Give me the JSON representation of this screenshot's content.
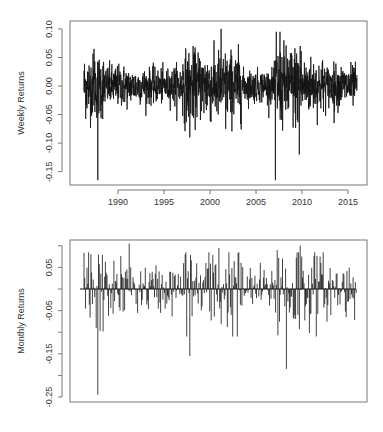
{
  "chart_data": [
    {
      "type": "line",
      "title": "",
      "xlabel": "",
      "ylabel": "Weekly Returns",
      "x_ticks": [
        1990,
        1995,
        2000,
        2005,
        2010,
        2015
      ],
      "y_ticks": [
        0.1,
        0.05,
        0.0,
        -0.05,
        -0.1,
        -0.15
      ],
      "y_tick_labels": [
        "0.10",
        "0.05",
        "0.00",
        "-0.05",
        "-0.10",
        "-0.15"
      ],
      "xlim": [
        1985.6,
        2017.4
      ],
      "ylim": [
        -0.17,
        0.105
      ],
      "x_range_data": [
        1986.3,
        2016.0
      ],
      "grid": false,
      "legend": null,
      "notable_points": [
        {
          "x": 1987.8,
          "y": -0.165
        },
        {
          "x": 1987.4,
          "y": 0.065
        },
        {
          "x": 1997.8,
          "y": -0.09
        },
        {
          "x": 2001.2,
          "y": 0.1
        },
        {
          "x": 2001.7,
          "y": -0.075
        },
        {
          "x": 2007.2,
          "y": 0.095
        },
        {
          "x": 2007.6,
          "y": 0.095
        },
        {
          "x": 2007.1,
          "y": -0.165
        },
        {
          "x": 2009.8,
          "y": 0.07
        },
        {
          "x": 2009.7,
          "y": -0.12
        },
        {
          "x": 2013.5,
          "y": -0.065
        }
      ]
    },
    {
      "type": "bar",
      "title": "",
      "xlabel": "",
      "ylabel": "Monthly Returns",
      "y_ticks": [
        0.1,
        0.05,
        0.0,
        -0.05,
        -0.1,
        -0.15,
        -0.2,
        -0.25
      ],
      "y_tick_labels": [
        "",
        "0.05",
        "",
        "-0.05",
        "",
        "-0.15",
        "",
        "-0.25"
      ],
      "ylim": [
        -0.265,
        0.125
      ],
      "x_range_data": [
        1986.3,
        2016.0
      ],
      "grid": false,
      "legend": null,
      "notable_points": [
        {
          "x": 1987.8,
          "y": -0.245
        },
        {
          "x": 1987.6,
          "y": -0.09
        },
        {
          "x": 1991.2,
          "y": 0.105
        },
        {
          "x": 1997.8,
          "y": -0.155
        },
        {
          "x": 2001.0,
          "y": 0.095
        },
        {
          "x": 2007.3,
          "y": 0.09
        },
        {
          "x": 2008.3,
          "y": -0.185
        },
        {
          "x": 2009.8,
          "y": 0.1
        },
        {
          "x": 2012.0,
          "y": 0.075
        }
      ]
    }
  ],
  "panels": {
    "weekly": {
      "ylabel": "Weekly Returns"
    },
    "monthly": {
      "ylabel": "Monthly Returns"
    }
  }
}
